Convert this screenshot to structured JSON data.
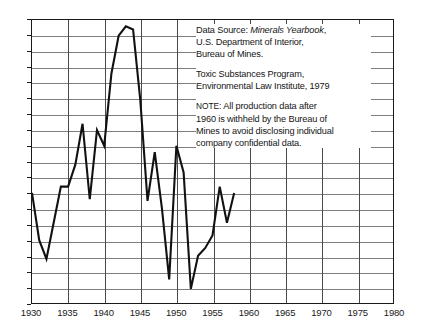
{
  "chart_data": {
    "type": "line",
    "title": "",
    "xlabel": "",
    "ylabel": "",
    "xlim": [
      1930,
      1980
    ],
    "ylim": [
      12,
      48
    ],
    "grid": true,
    "legend_position": "none",
    "xticks": [
      1930,
      1935,
      1940,
      1945,
      1950,
      1955,
      1960,
      1965,
      1970,
      1975,
      1980
    ],
    "yticks": [
      48,
      46,
      44,
      42,
      40,
      38,
      36,
      34,
      32,
      30,
      28,
      26,
      24,
      22,
      20,
      18,
      16,
      14,
      12
    ],
    "x": [
      1930,
      1931,
      1932,
      1933,
      1934,
      1935,
      1936,
      1937,
      1938,
      1939,
      1940,
      1941,
      1942,
      1943,
      1944,
      1945,
      1946,
      1947,
      1948,
      1949,
      1950,
      1951,
      1952,
      1953,
      1954,
      1955,
      1956,
      1957,
      1958
    ],
    "values": [
      26.0,
      20.0,
      17.6,
      22.2,
      26.8,
      26.8,
      29.6,
      34.8,
      25.2,
      34.0,
      32.0,
      41.2,
      46.0,
      47.2,
      46.8,
      37.8,
      25.0,
      31.2,
      24.0,
      15.0,
      32.0,
      28.6,
      13.8,
      18.0,
      19.0,
      20.6,
      26.8,
      22.2,
      26.0
    ],
    "annotations": [
      "Data Source:  Minerals Yearbook, U.S. Department of Interior, Bureau of Mines.",
      "Toxic Substances Program, Environmental Law Institute, 1979",
      "NOTE:  All production data after 1960 is withheld by the Bureau of Mines to avoid disclosing individual company confidential data."
    ]
  },
  "notes": {
    "block1": {
      "lead": "Data Source:",
      "italic": "Minerals Yearbook",
      "line1_tail": ",",
      "line2": "U.S. Department of Interior,",
      "line3": "Bureau of Mines."
    },
    "block2": {
      "line1": "Toxic Substances Program,",
      "line2": "Environmental Law Institute, 1979"
    },
    "block3": {
      "label": "NOTE:",
      "line1": "All production data after",
      "line2": "1960 is withheld by the Bureau of",
      "line3": "Mines to avoid disclosing individual",
      "line4": "company confidential data."
    }
  },
  "axis": {
    "x_labels": [
      "1930",
      "1935",
      "1940",
      "1945",
      "1950",
      "1955",
      "1960",
      "1965",
      "1970",
      "1975",
      "1980"
    ],
    "y_labels": [
      "48",
      "46",
      "44",
      "42",
      "40",
      "38",
      "36",
      "34",
      "32",
      "30",
      "28",
      "26",
      "24",
      "22",
      "20",
      "18",
      "16",
      "14",
      "12"
    ]
  },
  "colors": {
    "line": "#111111",
    "grid": "#7d7d7d",
    "frame": "#1a1a1a",
    "text": "#151515"
  }
}
